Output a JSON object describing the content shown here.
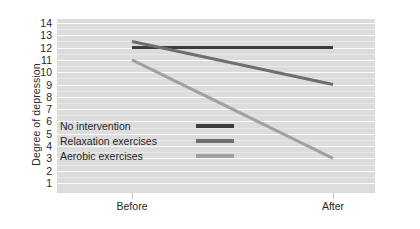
{
  "chart_data": {
    "type": "line",
    "title": "",
    "xlabel": "",
    "ylabel": "Degree of depression",
    "categories": [
      "Before",
      "After"
    ],
    "x_tick_labels": [
      "Before",
      "After"
    ],
    "y_tick_labels": [
      "14",
      "13",
      "12",
      "11",
      "10",
      "9",
      "8",
      "7",
      "6",
      "5",
      "4",
      "3",
      "2",
      "1"
    ],
    "ylim": [
      1,
      14
    ],
    "grid": true,
    "legend_position": "inside-left",
    "series": [
      {
        "name": "No intervention",
        "values": [
          12,
          12
        ],
        "color": "#3c3c3c"
      },
      {
        "name": "Relaxation exercises",
        "values": [
          12.5,
          9
        ],
        "color": "#6e6e6e"
      },
      {
        "name": "Aerobic exercises",
        "values": [
          11,
          3
        ],
        "color": "#a0a0a0"
      }
    ]
  },
  "plot": {
    "background_color": "#dcdcdc",
    "gridline_color": "#fdfdfd"
  },
  "legend": {
    "entries": [
      {
        "label": "No intervention",
        "color": "#3c3c3c"
      },
      {
        "label": "Relaxation exercises",
        "color": "#6e6e6e"
      },
      {
        "label": "Aerobic exercises",
        "color": "#a0a0a0"
      }
    ]
  }
}
